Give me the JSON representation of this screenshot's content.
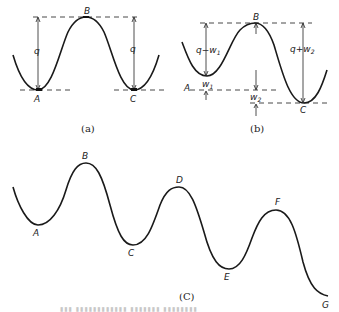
{
  "figure": {
    "panel_a": {
      "caption": "(a)",
      "points": [
        "A",
        "B",
        "C"
      ],
      "left_measure": "q",
      "right_measure": "q"
    },
    "panel_b": {
      "caption": "(b)",
      "points": [
        "A",
        "B",
        "C"
      ],
      "left_upper_measure": "q−w",
      "left_upper_sub": "1",
      "left_lower_measure": "w",
      "left_lower_sub": "1",
      "mid_lower_measure": "w",
      "mid_lower_sub": "2",
      "right_measure": "q+w",
      "right_sub": "2"
    },
    "panel_c": {
      "caption": "(C)",
      "points": [
        "A",
        "B",
        "C",
        "D",
        "E",
        "F",
        "G"
      ]
    },
    "bottom_caption_faint": "▮▮▮ ▮▮▮▮▮▮▮▮▮▮▮▮ ▮▮▮▮▮▮▮ ▮▮▮▮▮▮▮▮"
  }
}
